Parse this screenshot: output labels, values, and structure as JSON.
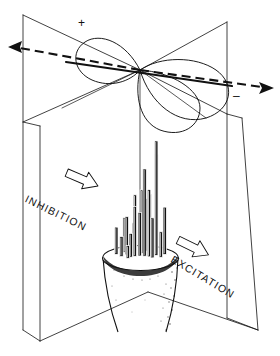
{
  "figure": {
    "background_color": "#ffffff",
    "ink_color": "#111111"
  },
  "polarity_markers": [
    {
      "name": "plus",
      "symbol": "+",
      "x": 82,
      "y": 23
    },
    {
      "name": "minus",
      "symbol": "–",
      "x": 236,
      "y": 96
    }
  ],
  "direction_labels": [
    {
      "name": "inhibition",
      "text": "INHIBITION",
      "arrow_direction": "left",
      "x": 30,
      "y": 196,
      "rotation": 26,
      "arrow_x": 98,
      "arrow_y": 186,
      "arrow_rotation": 205
    },
    {
      "name": "excitation",
      "text": "EXCITATION",
      "arrow_direction": "right",
      "x": 170,
      "y": 258,
      "rotation": 31,
      "arrow_x": 186,
      "arrow_y": 242,
      "arrow_rotation": 25
    }
  ],
  "axis_arrows": [
    {
      "name": "left-axis-arrow",
      "style": "dashed",
      "from_x": 140,
      "from_y": 70,
      "to_x": 10,
      "to_y": 47
    },
    {
      "name": "right-axis-arrow",
      "style": "dashed",
      "from_x": 140,
      "from_y": 70,
      "to_x": 272,
      "to_y": 88
    }
  ],
  "lobes": [
    {
      "name": "upper-left-lobe",
      "polarity": "+"
    },
    {
      "name": "right-lobe",
      "polarity": "–"
    },
    {
      "name": "lower-center-lobe",
      "polarity": "–"
    }
  ],
  "planes": [
    {
      "name": "left-plane",
      "orientation": "vertical-receding"
    },
    {
      "name": "right-plane",
      "orientation": "vertical-receding"
    }
  ],
  "soma": {
    "name": "cell-body",
    "shape": "tapered-cylinder"
  },
  "chart_data": {
    "type": "bar",
    "xlabel": "",
    "ylabel": "",
    "categories": [
      "1",
      "2",
      "3",
      "4",
      "5",
      "6",
      "7",
      "8",
      "9",
      "10",
      "11",
      "12",
      "13",
      "14",
      "15",
      "16",
      "17",
      "18",
      "19",
      "20"
    ],
    "values": [
      14,
      22,
      30,
      26,
      42,
      38,
      55,
      34,
      62,
      48,
      70,
      58,
      96,
      66,
      108,
      74,
      126,
      52,
      44,
      28
    ],
    "ylim": [
      0,
      130
    ],
    "grid": false,
    "legend": null
  }
}
